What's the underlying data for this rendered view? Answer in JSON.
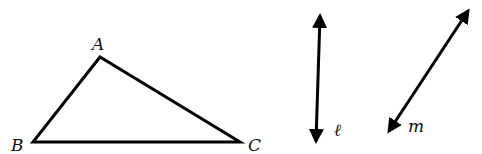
{
  "diagram": {
    "triangle": {
      "vertices": [
        {
          "name": "A",
          "x": 100,
          "y": 57,
          "label_x": 92,
          "label_y": 50
        },
        {
          "name": "B",
          "x": 33,
          "y": 142,
          "label_x": 11,
          "label_y": 151
        },
        {
          "name": "C",
          "x": 240,
          "y": 142,
          "label_x": 248,
          "label_y": 151
        }
      ]
    },
    "lines": [
      {
        "name": "ℓ",
        "x1": 320,
        "y1": 16,
        "x2": 316,
        "y2": 141,
        "label_x": 334,
        "label_y": 136
      },
      {
        "name": "m",
        "x1": 468,
        "y1": 11,
        "x2": 389,
        "y2": 131,
        "label_x": 408,
        "label_y": 132
      }
    ],
    "stroke_color": "#000000",
    "label_color": "#111111"
  }
}
